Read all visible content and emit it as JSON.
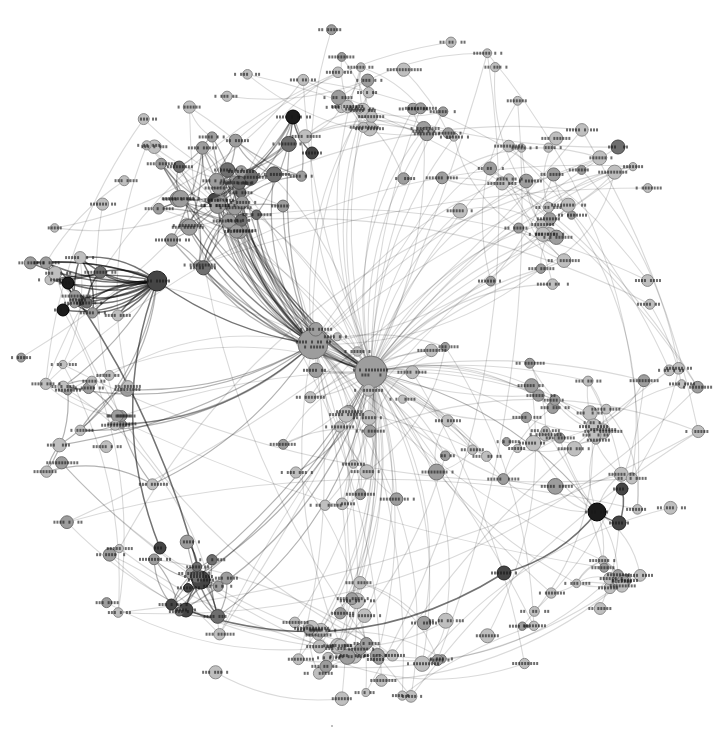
{
  "figure": {
    "kind": "social-network-graph",
    "labels_legible": false
  },
  "chart_data": {
    "type": "network",
    "title": "",
    "canvas": {
      "width": 717,
      "height": 737,
      "background": "#ffffff"
    },
    "layout": {
      "cx": 358,
      "cy": 368,
      "max_radius": 352,
      "edge_curvature": 0.16
    },
    "seed": 1337,
    "palette": {
      "background": "#ffffff",
      "node_fill": {
        "light": "#bfbfbf",
        "mid": "#9d9d9d",
        "middark": "#6f6f6f",
        "dark": "#454545",
        "darkest": "#1b1b1b"
      },
      "node_stroke": {
        "light": "#8c8c8c",
        "mid": "#707070",
        "middark": "#4a4a4a",
        "dark": "#262626",
        "darkest": "#000000"
      },
      "edge": {
        "light": "rgba(0,0,0,0.15)",
        "mid": "rgba(0,0,0,0.30)",
        "dark": "rgba(0,0,0,0.55)"
      },
      "edge_width": {
        "light": 1.1,
        "mid": 1.25,
        "dark": 1.5
      },
      "label": "rgba(22,22,22,0.62)"
    },
    "hubs": [
      {
        "id": "hubA",
        "x": 313,
        "y": 344,
        "r": 15,
        "shade": "mid",
        "label_w": 34,
        "two_line": true
      },
      {
        "id": "hubB",
        "x": 371,
        "y": 372,
        "r": 16,
        "shade": "mid",
        "label_w": 36,
        "two_line": true
      },
      {
        "id": "hubL",
        "x": 157,
        "y": 281,
        "r": 10,
        "shade": "dark",
        "label_w": 26
      },
      {
        "id": "hubSW",
        "x": 201,
        "y": 580,
        "r": 9,
        "shade": "dark",
        "label_w": 26
      },
      {
        "id": "darkE1",
        "x": 597,
        "y": 512,
        "r": 9,
        "shade": "darkest",
        "label_w": 24
      },
      {
        "id": "darkE2",
        "x": 619,
        "y": 523,
        "r": 7,
        "shade": "dark",
        "label_w": 20
      },
      {
        "id": "darkE3",
        "x": 622,
        "y": 489,
        "r": 6,
        "shade": "dark",
        "label_w": 18
      },
      {
        "id": "darkSE",
        "x": 504,
        "y": 573,
        "r": 7,
        "shade": "dark",
        "label_w": 26
      },
      {
        "id": "darkNW",
        "x": 293,
        "y": 117,
        "r": 7,
        "shade": "darkest",
        "label_w": 34
      },
      {
        "id": "darkNW2",
        "x": 312,
        "y": 153,
        "r": 6,
        "shade": "dark",
        "label_w": 20
      },
      {
        "id": "darkL1",
        "x": 68,
        "y": 283,
        "r": 6,
        "shade": "darkest",
        "label_w": 18
      },
      {
        "id": "darkL2",
        "x": 78,
        "y": 300,
        "r": 6,
        "shade": "dark",
        "label_w": 18
      },
      {
        "id": "darkL3",
        "x": 63,
        "y": 310,
        "r": 6,
        "shade": "darkest",
        "label_w": 18
      },
      {
        "id": "darkSW1",
        "x": 160,
        "y": 548,
        "r": 6,
        "shade": "dark",
        "label_w": 18
      },
      {
        "id": "darkSW2",
        "x": 186,
        "y": 610,
        "r": 7,
        "shade": "dark",
        "label_w": 20
      },
      {
        "id": "midNE",
        "x": 618,
        "y": 147,
        "r": 7,
        "shade": "middark",
        "label_w": 20
      }
    ],
    "clusters": [
      {
        "id": "nw-dense",
        "cx": 228,
        "cy": 200,
        "rx": 90,
        "ry": 88,
        "count": 36,
        "rmin": 4.5,
        "rmax": 8.5,
        "shades": {
          "mid": 0.6,
          "middark": 0.3,
          "dark": 0.1
        },
        "edge": "mid",
        "intra": 2,
        "links": [
          [
            "hubA",
            0.5
          ],
          [
            "hubB",
            0.45
          ],
          [
            "darkNW",
            0.12
          ]
        ]
      },
      {
        "id": "far-left",
        "cx": 72,
        "cy": 286,
        "rx": 52,
        "ry": 55,
        "count": 10,
        "rmin": 4.5,
        "rmax": 7,
        "shades": {
          "mid": 0.5,
          "middark": 0.3,
          "light": 0.2
        },
        "edge": "dark",
        "intra": 1,
        "links": [
          [
            "hubL",
            0.95
          ]
        ],
        "double_arc": 0.5
      },
      {
        "id": "left-mid",
        "cx": 100,
        "cy": 430,
        "rx": 70,
        "ry": 85,
        "count": 16,
        "rmin": 4,
        "rmax": 7,
        "shades": {
          "light": 0.5,
          "mid": 0.5
        },
        "edge": "mid",
        "intra": 1,
        "links": [
          [
            "hubA",
            0.3
          ],
          [
            "hubL",
            0.2
          ]
        ]
      },
      {
        "id": "sw",
        "cx": 195,
        "cy": 577,
        "rx": 55,
        "ry": 50,
        "count": 12,
        "rmin": 4,
        "rmax": 7.5,
        "shades": {
          "mid": 0.5,
          "middark": 0.3,
          "dark": 0.2
        },
        "edge": "mid",
        "intra": 2,
        "links": [
          [
            "hubSW",
            0.7
          ],
          [
            "hubB",
            0.2
          ]
        ]
      },
      {
        "id": "south",
        "cx": 350,
        "cy": 645,
        "rx": 120,
        "ry": 68,
        "count": 26,
        "rmin": 4,
        "rmax": 8,
        "shades": {
          "light": 0.55,
          "mid": 0.45
        },
        "edge": "light",
        "intra": 1,
        "links": [
          [
            "hubB",
            0.35
          ],
          [
            "hubA",
            0.1
          ]
        ]
      },
      {
        "id": "se-mini",
        "cx": 616,
        "cy": 585,
        "rx": 42,
        "ry": 33,
        "count": 9,
        "rmin": 4,
        "rmax": 7,
        "shades": {
          "light": 0.6,
          "mid": 0.4
        },
        "edge": "light",
        "intra": 2,
        "links": [
          [
            "darkE1",
            0.3
          ]
        ]
      },
      {
        "id": "east",
        "cx": 556,
        "cy": 425,
        "rx": 105,
        "ry": 80,
        "count": 26,
        "rmin": 4,
        "rmax": 8,
        "shades": {
          "light": 0.5,
          "mid": 0.5
        },
        "edge": "light",
        "intra": 1,
        "links": [
          [
            "hubB",
            0.5
          ],
          [
            "darkE1",
            0.15
          ]
        ]
      },
      {
        "id": "ne",
        "cx": 548,
        "cy": 205,
        "rx": 115,
        "ry": 95,
        "count": 28,
        "rmin": 4,
        "rmax": 7.5,
        "shades": {
          "light": 0.55,
          "mid": 0.45
        },
        "edge": "light",
        "intra": 1,
        "links": [
          [
            "hubB",
            0.4
          ],
          [
            "hubA",
            0.1
          ]
        ]
      },
      {
        "id": "north",
        "cx": 392,
        "cy": 115,
        "rx": 115,
        "ry": 70,
        "count": 22,
        "rmin": 4,
        "rmax": 7.5,
        "shades": {
          "light": 0.5,
          "mid": 0.5
        },
        "edge": "light",
        "intra": 1,
        "links": [
          [
            "hubB",
            0.35
          ],
          [
            "hubA",
            0.25
          ]
        ]
      },
      {
        "id": "center",
        "cx": 362,
        "cy": 420,
        "rx": 130,
        "ry": 105,
        "count": 28,
        "rmin": 4,
        "rmax": 8,
        "shades": {
          "light": 0.45,
          "mid": 0.55
        },
        "edge": "light",
        "intra": 1,
        "links": [
          [
            "hubB",
            0.5
          ],
          [
            "hubA",
            0.35
          ]
        ]
      }
    ],
    "ring": {
      "count": 58,
      "r0": 295,
      "r1": 348,
      "rmin": 4,
      "rmax": 7,
      "shades": {
        "light": 0.7,
        "mid": 0.3
      },
      "edge": "light",
      "neighbor_p": 0.35
    },
    "long_arcs": 14,
    "hub_fan": {
      "hubA": 10,
      "hubB": 14
    },
    "extra_edges": [
      [
        "hubA",
        "hubB",
        "mid"
      ],
      [
        "hubL",
        "hubA",
        "dark"
      ],
      [
        "hubL",
        "darkSW1",
        "dark"
      ],
      [
        "hubSW",
        "darkSW2",
        "dark"
      ],
      [
        "hubSW",
        "darkL2",
        "dark"
      ],
      [
        "darkE1",
        "darkE2",
        "dark"
      ],
      [
        "darkE2",
        "darkE3",
        "dark"
      ],
      [
        "darkE1",
        "hubB",
        "mid"
      ],
      [
        "darkSE",
        "darkE1",
        "dark"
      ],
      [
        "darkSW2",
        "darkSE",
        "dark"
      ],
      [
        "darkNW",
        "darkNW2",
        "dark"
      ],
      [
        "darkNW",
        "hubA",
        "mid"
      ],
      [
        "midNE",
        "hubB",
        "light"
      ],
      [
        "darkL1",
        "darkL2",
        "dark"
      ],
      [
        "darkL2",
        "darkL3",
        "dark"
      ],
      [
        "darkL3",
        "hubL",
        "dark"
      ],
      [
        "darkL1",
        "hubL",
        "dark"
      ]
    ],
    "label_style": {
      "height": 3,
      "seg_on": 2,
      "seg_step": 3,
      "word_gap_p": 0.18
    },
    "stray_mark": {
      "x": 331,
      "y": 725,
      "w": 2,
      "h": 2,
      "color": "rgba(0,0,0,0.25)"
    }
  }
}
